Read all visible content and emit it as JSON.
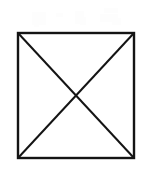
{
  "canvas": {
    "width": 145,
    "height": 177,
    "background_color": "#ffffff",
    "title": "Square with diagonals"
  },
  "figure": {
    "name": "square-with-diagonals",
    "stroke_color": "#141414",
    "fill_color": "none",
    "border_stroke_width": 2.4,
    "diagonal_stroke_width": 2.0,
    "square": {
      "x": 18,
      "y": 33,
      "width": 116,
      "height": 125,
      "corners": {
        "top_left": [
          18,
          33
        ],
        "top_right": [
          134,
          33
        ],
        "bottom_right": [
          134,
          158
        ],
        "bottom_left": [
          18,
          158
        ]
      }
    },
    "diagonals": [
      {
        "name": "diagonal-tl-br",
        "from": [
          18,
          33
        ],
        "to": [
          134,
          158
        ]
      },
      {
        "name": "diagonal-tr-bl",
        "from": [
          134,
          33
        ],
        "to": [
          18,
          158
        ]
      }
    ],
    "center_point": [
      76,
      95.5
    ]
  },
  "artifacts": {
    "name": "scan-artifacts",
    "color": "#fdfdfd",
    "marks": [
      {
        "x": 32,
        "y": 12,
        "width": 14,
        "height": 13
      },
      {
        "x": 34,
        "y": 18,
        "width": 5,
        "height": 9
      },
      {
        "x": 56,
        "y": 13,
        "width": 7,
        "height": 4
      },
      {
        "x": 75,
        "y": 11,
        "width": 9,
        "height": 13
      },
      {
        "x": 80,
        "y": 17,
        "width": 6,
        "height": 8
      },
      {
        "x": 100,
        "y": 14,
        "width": 18,
        "height": 8
      },
      {
        "x": 104,
        "y": 8,
        "width": 14,
        "height": 5
      },
      {
        "x": 112,
        "y": 18,
        "width": 9,
        "height": 7
      }
    ]
  }
}
